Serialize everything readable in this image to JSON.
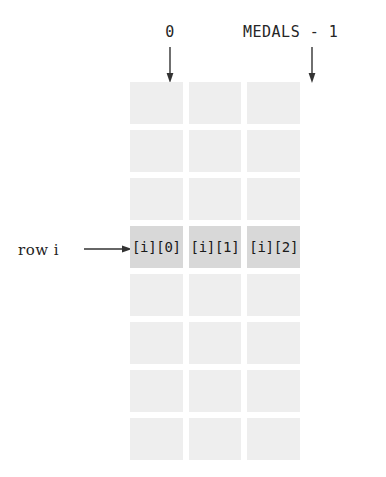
{
  "diagram": {
    "column_labels": {
      "first": "0",
      "last": "MEDALS - 1"
    },
    "row_label": "row i",
    "grid": {
      "rows": 8,
      "columns": 3,
      "highlighted_row_index": 3,
      "cell_color": "#eeeeee",
      "highlight_color": "#d8d8d8",
      "cells": [
        [
          "",
          "",
          ""
        ],
        [
          "",
          "",
          ""
        ],
        [
          "",
          "",
          ""
        ],
        [
          "[i][0]",
          "[i][1]",
          "[i][2]"
        ],
        [
          "",
          "",
          ""
        ],
        [
          "",
          "",
          ""
        ],
        [
          "",
          "",
          ""
        ],
        [
          "",
          "",
          ""
        ]
      ]
    }
  }
}
